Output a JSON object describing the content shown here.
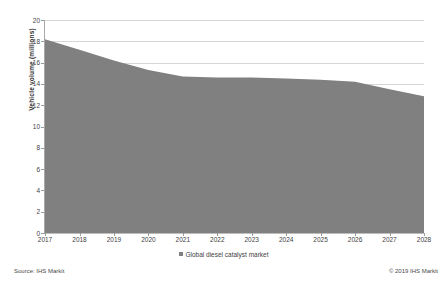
{
  "chart_data": {
    "type": "area",
    "title": "",
    "xlabel": "",
    "ylabel": "Vehicle volume (millions)",
    "categories": [
      "2017",
      "2018",
      "2019",
      "2020",
      "2021",
      "2022",
      "2023",
      "2024",
      "2025",
      "2026",
      "2027",
      "2028"
    ],
    "series": [
      {
        "name": "Global diesel catalyst market",
        "color": "#808080",
        "values": [
          18.2,
          17.2,
          16.2,
          15.3,
          14.7,
          14.6,
          14.6,
          14.5,
          14.4,
          14.2,
          13.5,
          12.85
        ]
      }
    ],
    "ylim": [
      0,
      20
    ],
    "yticks": [
      0,
      2,
      4,
      6,
      8,
      10,
      12,
      14,
      16,
      18,
      20
    ],
    "ytick_labels": [
      "0",
      "2",
      "4",
      "6",
      "8",
      "10",
      "12",
      "14",
      "16",
      "18",
      "20"
    ],
    "grid": true,
    "legend_position": "bottom"
  },
  "legend": {
    "entries": [
      {
        "label": "Global diesel catalyst market",
        "color": "#808080"
      }
    ]
  },
  "footer": {
    "source": "Source: IHS Markit",
    "copyright": "© 2019 IHS Markit"
  }
}
